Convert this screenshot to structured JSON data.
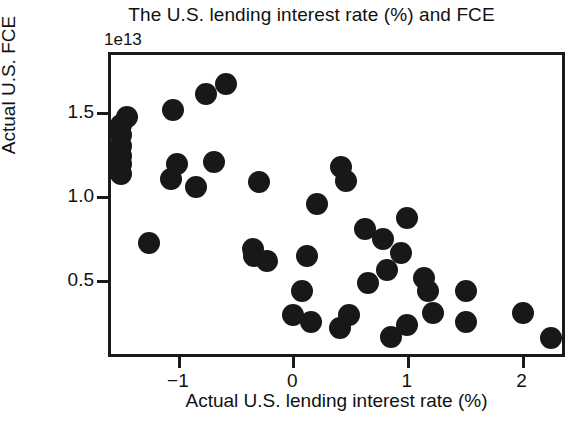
{
  "chart_data": {
    "type": "scatter",
    "title": "The U.S. lending interest rate (%) and FCE",
    "xlabel": "Actual U.S. lending interest rate (%)",
    "ylabel": "Actual U.S. FCE",
    "y_offset_label": "1e13",
    "grid": false,
    "legend": null,
    "xlim": [
      -1.61,
      2.38
    ],
    "ylim": [
      0.04,
      1.86
    ],
    "xticks": [
      -1,
      0,
      1,
      2
    ],
    "xtick_labels": [
      "−1",
      "0",
      "1",
      "2"
    ],
    "yticks": [
      0.5,
      1.0,
      1.5
    ],
    "ytick_labels": [
      "0.5",
      "1.0",
      "1.5"
    ],
    "marker_color": "#181818",
    "marker_size_px": 22,
    "points": [
      {
        "x": -1.47,
        "y": 1.49
      },
      {
        "x": -1.52,
        "y": 1.44
      },
      {
        "x": -1.52,
        "y": 1.38
      },
      {
        "x": -1.52,
        "y": 1.32
      },
      {
        "x": -1.52,
        "y": 1.26
      },
      {
        "x": -1.52,
        "y": 1.21
      },
      {
        "x": -1.52,
        "y": 1.15
      },
      {
        "x": -1.07,
        "y": 1.53
      },
      {
        "x": -0.78,
        "y": 1.63
      },
      {
        "x": -0.61,
        "y": 1.69
      },
      {
        "x": -1.03,
        "y": 1.21
      },
      {
        "x": -1.09,
        "y": 1.12
      },
      {
        "x": -0.87,
        "y": 1.07
      },
      {
        "x": -0.71,
        "y": 1.22
      },
      {
        "x": -0.32,
        "y": 1.1
      },
      {
        "x": 0.4,
        "y": 1.19
      },
      {
        "x": 0.44,
        "y": 1.11
      },
      {
        "x": -1.28,
        "y": 0.74
      },
      {
        "x": -0.37,
        "y": 0.7
      },
      {
        "x": -0.36,
        "y": 0.66
      },
      {
        "x": -0.25,
        "y": 0.63
      },
      {
        "x": 0.19,
        "y": 0.97
      },
      {
        "x": 0.97,
        "y": 0.89
      },
      {
        "x": 0.61,
        "y": 0.82
      },
      {
        "x": 0.76,
        "y": 0.76
      },
      {
        "x": 0.92,
        "y": 0.68
      },
      {
        "x": 0.1,
        "y": 0.66
      },
      {
        "x": 0.8,
        "y": 0.58
      },
      {
        "x": 0.63,
        "y": 0.5
      },
      {
        "x": 1.12,
        "y": 0.53
      },
      {
        "x": 0.06,
        "y": 0.45
      },
      {
        "x": -0.02,
        "y": 0.31
      },
      {
        "x": 0.14,
        "y": 0.27
      },
      {
        "x": 0.47,
        "y": 0.31
      },
      {
        "x": 0.39,
        "y": 0.23
      },
      {
        "x": 0.83,
        "y": 0.18
      },
      {
        "x": 0.97,
        "y": 0.25
      },
      {
        "x": 1.16,
        "y": 0.45
      },
      {
        "x": 1.2,
        "y": 0.32
      },
      {
        "x": 1.49,
        "y": 0.45
      },
      {
        "x": 1.49,
        "y": 0.27
      },
      {
        "x": 1.99,
        "y": 0.32
      },
      {
        "x": 2.23,
        "y": 0.17
      }
    ]
  }
}
